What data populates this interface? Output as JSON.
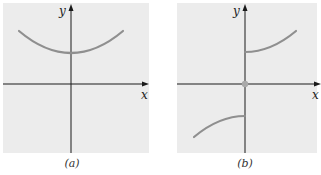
{
  "colors": {
    "panel_bg": "#ececec",
    "axis": "#1a1a1a",
    "curve": "#8f8f8f",
    "point": "#a9a9a9"
  },
  "panels": [
    {
      "caption": "(a)",
      "x_label": "x",
      "y_label": "y",
      "description": "Continuous U-shaped curve above the x-axis with a minimum on the y-axis"
    },
    {
      "caption": "(b)",
      "x_label": "x",
      "y_label": "y",
      "description": "Odd function with jump discontinuity at x=0: increasing branch for x>0 starting above the origin, branch for x<0 ending below the origin, isolated point at origin"
    }
  ]
}
